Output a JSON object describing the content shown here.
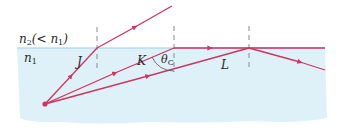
{
  "diagram": {
    "title": "",
    "colors": {
      "medium_fill": "#dff1f8",
      "interface_line": "#9fcfe3",
      "ray": "#d2325f",
      "normal": "#8a8a8a",
      "text": "#2b2b2b"
    },
    "media": {
      "upper_label_main": "n",
      "upper_label_sub": "2",
      "upper_label_rest": "(< n",
      "upper_label_rest_sub": "1",
      "upper_label_close": ")",
      "lower_label_main": "n",
      "lower_label_sub": "1"
    },
    "rays": [
      {
        "id": "J",
        "label": "J",
        "behavior": "refracted into n2"
      },
      {
        "id": "K",
        "label": "K",
        "behavior": "at critical angle, travels along interface"
      },
      {
        "id": "L",
        "label": "L",
        "behavior": "totally internally reflected"
      }
    ],
    "angle": {
      "symbol": "θ",
      "sub": "C"
    }
  }
}
